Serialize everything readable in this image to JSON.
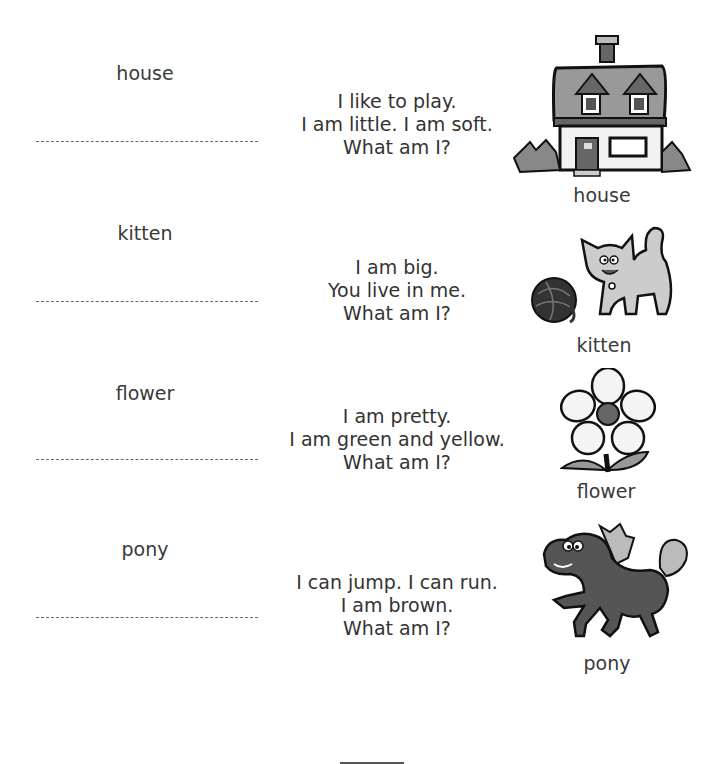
{
  "word_bank": [
    {
      "word": "house"
    },
    {
      "word": "kitten"
    },
    {
      "word": "flower"
    },
    {
      "word": "pony"
    }
  ],
  "riddles": [
    {
      "lines": [
        "I like to play.",
        "I am little. I am soft.",
        "What am I?"
      ]
    },
    {
      "lines": [
        "I am big.",
        "You live in me.",
        "What am I?"
      ]
    },
    {
      "lines": [
        "I am pretty.",
        "I am green and yellow.",
        "What am I?"
      ]
    },
    {
      "lines": [
        "I can jump. I can run.",
        "I am brown.",
        "What am I?"
      ]
    }
  ],
  "pictures": [
    {
      "icon": "house-icon",
      "caption": "house"
    },
    {
      "icon": "kitten-icon",
      "caption": "kitten"
    },
    {
      "icon": "flower-icon",
      "caption": "flower"
    },
    {
      "icon": "pony-icon",
      "caption": "pony"
    }
  ]
}
